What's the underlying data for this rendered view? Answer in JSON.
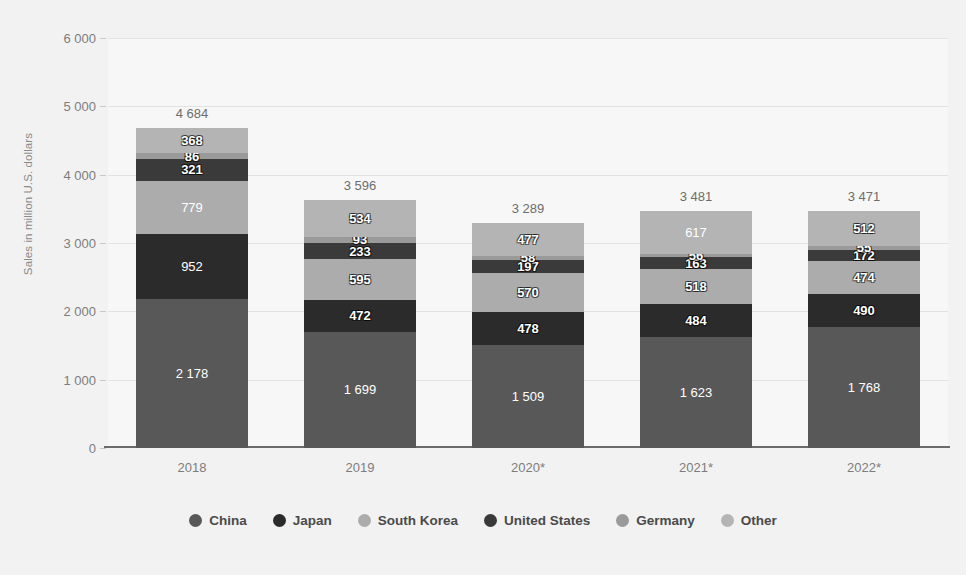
{
  "chart_data": {
    "type": "bar",
    "subtype": "stacked-column",
    "title": "",
    "xlabel": "",
    "ylabel": "Sales in million U.S. dollars",
    "categories": [
      "2018",
      "2019",
      "2020*",
      "2021*",
      "2022*"
    ],
    "ylim": [
      0,
      6000
    ],
    "yticks": [
      "0",
      "1 000",
      "2 000",
      "3 000",
      "4 000",
      "5 000",
      "6 000"
    ],
    "ytick_values": [
      0,
      1000,
      2000,
      3000,
      4000,
      5000,
      6000
    ],
    "grid": true,
    "legend_position": "bottom",
    "series": [
      {
        "name": "China",
        "color": "#585858",
        "values": [
          2178,
          1699,
          1509,
          1623,
          1768
        ],
        "labels": [
          "2 178",
          "1 699",
          "1 509",
          "1 623",
          "1 768"
        ]
      },
      {
        "name": "Japan",
        "color": "#2b2b2b",
        "values": [
          952,
          472,
          478,
          484,
          490
        ],
        "labels": [
          "952",
          "472",
          "478",
          "484",
          "490"
        ]
      },
      {
        "name": "South Korea",
        "color": "#acacac",
        "values": [
          779,
          595,
          570,
          518,
          474
        ],
        "labels": [
          "779",
          "595",
          "570",
          "518",
          "474"
        ]
      },
      {
        "name": "United States",
        "color": "#3a3a3a",
        "values": [
          321,
          233,
          197,
          163,
          172
        ],
        "labels": [
          "321",
          "233",
          "197",
          "163",
          "172"
        ]
      },
      {
        "name": "Germany",
        "color": "#9a9a9a",
        "values": [
          86,
          93,
          58,
          56,
          55
        ],
        "labels": [
          "86",
          "93",
          "58",
          "56",
          "55"
        ]
      },
      {
        "name": "Other",
        "color": "#b4b4b4",
        "values": [
          368,
          534,
          477,
          617,
          512
        ],
        "labels": [
          "368",
          "534",
          "477",
          "617",
          "512"
        ]
      }
    ],
    "totals": [
      4684,
      3596,
      3289,
      3481,
      3471
    ],
    "total_labels": [
      "4 684",
      "3 596",
      "3 289",
      "3 481",
      "3 471"
    ]
  },
  "colors": {
    "background": "#f2f2f2",
    "plot_background": "#f7f7f7",
    "gridline": "#e2e2e2",
    "axis": "#6b6b6b",
    "tick_text": "#7d7d7d",
    "legend_text": "#4a4a4a"
  }
}
